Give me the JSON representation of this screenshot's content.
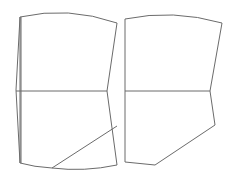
{
  "diagram": {
    "type": "sewing-pattern-pieces",
    "background": "#ffffff",
    "stroke_color": "#6b6b6b",
    "pieces": [
      {
        "name": "left-pattern-piece",
        "outline": "M20 17 Q68 6 117 23 L107 91 L117 165 Q84 172 52 168 Q34 167 20 163 Z",
        "outer_edge": "M20 17 L16 90 L20 163",
        "inner_edge": "M21 17 L21 163",
        "center_line": "M16 91 L107 91",
        "diagonal_line": "M52 168 L117 126"
      },
      {
        "name": "right-pattern-piece",
        "outline": "M125 19 Q173 9 222 23 L210 91 L215 125 L155 165 L125 162 Z",
        "center_line": "M125 91 L210 91"
      }
    ]
  }
}
